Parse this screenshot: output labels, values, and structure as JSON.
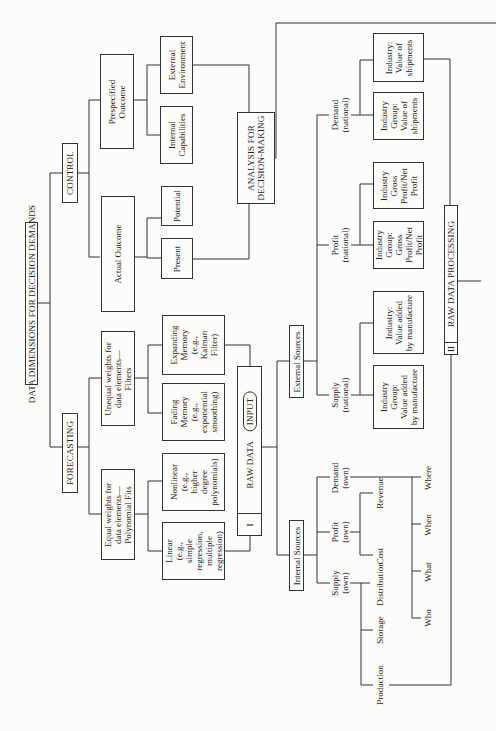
{
  "diagram": {
    "title": "DATA DIMENSIONS FOR DECISION DEMANDS",
    "control": {
      "label": "CONTROL",
      "actual_outcome": "Actual Outcome",
      "present": "Present",
      "potential": "Potential",
      "prespecified_outcome": "Prespecified\nOutcome",
      "internal_capabilities": "Internal\nCapabilities",
      "external_environment": "External\nEnvironment"
    },
    "forecasting": {
      "label": "FORECASTING",
      "equal_weights": "Equal weights for\ndata elements—\nPolynomial Fits",
      "linear": "Linear\n(e.g.,\nsimple\nregression,\nmultiple\nregression)",
      "nonlinear": "Nonlinear\n(e.g.,\nhigher\ndegree\npolynomials)",
      "unequal_weights": "Unequal weights for\ndata elements—\nFilters",
      "fading_memory": "Fading\nMemory\n(e.g.,\nexponential\nsmoothing)",
      "expanding_memory": "Expanding\nMemory\n(e.g.,\nKalman\nFilter)"
    },
    "analysis": "ANALYSIS FOR\nDECISION-MAKING",
    "raw_data": {
      "number": "I",
      "label": "RAW DATA",
      "badge": "INPUT"
    },
    "raw_data_processing": {
      "number": "II",
      "label": "RAW DATA PROCESSING"
    },
    "internal_sources": {
      "label": "Internal Sources",
      "supply": "Supply\n(own)",
      "profit": "Profit\n(own)",
      "demand": "Demand\n(own)",
      "supply_items": [
        "Production",
        "Storage",
        "Distribution"
      ],
      "profit_items": [
        "Cost",
        "Revenue"
      ],
      "demand_items": [
        "Who",
        "What",
        "When",
        "Where"
      ]
    },
    "external_sources": {
      "label": "External Sources",
      "supply": "Supply\n(national)",
      "profit": "Profit\n(national)",
      "demand": "Demand\n(national)",
      "supply_group": "Industry\nGroup:\nValue added\nby manufacture",
      "supply_industry": "Industry:\nValue added\nby manufacture",
      "profit_group": "Industry\nGroup:\nGross\nProfit/Net\nProfit",
      "profit_industry": "Industry\nGross\nProfit/Net\nProfit",
      "demand_group": "Industry\nGroup:\nValue of\nshipments",
      "demand_industry": "Industry:\nValue of\nshipments"
    }
  }
}
